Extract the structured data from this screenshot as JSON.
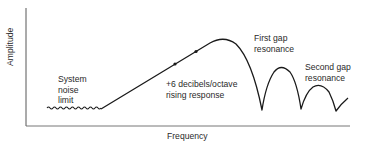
{
  "diagram": {
    "type": "frequency-response",
    "axes": {
      "x_label": "Frequency",
      "y_label": "Amplitude"
    },
    "annotations": {
      "noise": "System\nnoise\nlimit",
      "slope": "+6 decibels/octave\nrising response",
      "first_gap": "First gap\nresonance",
      "second_gap": "Second gap\nresonance"
    },
    "colors": {
      "line": "#1a1a1a",
      "axis": "#333333",
      "text": "#2a2a2a"
    }
  }
}
